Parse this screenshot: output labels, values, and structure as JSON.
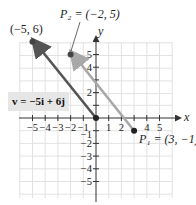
{
  "diagram": {
    "axes": {
      "x_label": "x",
      "y_label": "y",
      "x_ticks": [
        "−5",
        "−4",
        "−3",
        "−2",
        "−1",
        "1",
        "2",
        "4",
        "5"
      ],
      "y_ticks": [
        "5",
        "4",
        "2",
        "−1",
        "−2",
        "−3",
        "−4",
        "−5"
      ],
      "x_range": [
        -6,
        6
      ],
      "y_range": [
        -6,
        6
      ],
      "grid": true
    },
    "points": {
      "tip": {
        "label": "(−5, 6)",
        "x": -5,
        "y": 6
      },
      "p2": {
        "label": "P₂ = (−2, 5)",
        "name": "P2",
        "x": -2,
        "y": 5
      },
      "p1": {
        "label": "P₁ = (3, −1)",
        "name": "P1",
        "x": 3,
        "y": -1
      },
      "origin": {
        "x": 0,
        "y": 0
      }
    },
    "vector_label": "v = −5i + 6j",
    "colors": {
      "position_vector": "#555555",
      "segment_vector": "#a8a8a8",
      "grid": "#e2e2e2",
      "axis": "#333333",
      "label_box": "#e6e6e6"
    }
  }
}
